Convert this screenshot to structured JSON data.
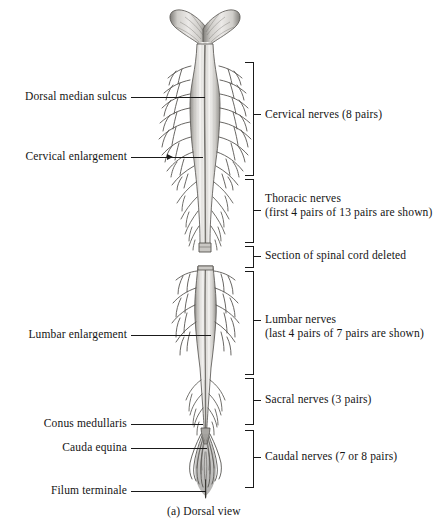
{
  "figure": {
    "caption": "(a) Dorsal view",
    "view": "Dorsal view of the spinal cord"
  },
  "left_labels": [
    {
      "id": "dorsal-median-sulcus",
      "text": "Dorsal median sulcus"
    },
    {
      "id": "cervical-enlargement",
      "text": "Cervical enlargement"
    },
    {
      "id": "lumbar-enlargement",
      "text": "Lumbar enlargement"
    },
    {
      "id": "conus-medullaris",
      "text": "Conus medullaris"
    },
    {
      "id": "cauda-equina",
      "text": "Cauda equina"
    },
    {
      "id": "filum-terminale",
      "text": "Filum terminale"
    }
  ],
  "right_brackets": [
    {
      "id": "cervical-nerves",
      "line1": "Cervical nerves (8 pairs)",
      "line2": ""
    },
    {
      "id": "thoracic-nerves",
      "line1": "Thoracic nerves",
      "line2": "(first 4 pairs of 13 pairs are shown)"
    },
    {
      "id": "section-deleted",
      "line1": "Section of spinal cord deleted",
      "line2": ""
    },
    {
      "id": "lumbar-nerves",
      "line1": "Lumbar nerves",
      "line2": "(last 4 pairs of 7 pairs are shown)"
    },
    {
      "id": "sacral-nerves",
      "line1": "Sacral nerves (3 pairs)",
      "line2": ""
    },
    {
      "id": "caudal-nerves",
      "line1": "Caudal nerves (7 or 8 pairs)",
      "line2": ""
    }
  ],
  "colors": {
    "ink": "#1a1a1a",
    "text": "#141414",
    "background": "#ffffff",
    "cord_light": "#f2f1ef",
    "cord_mid": "#b9b7b3",
    "cord_dark": "#6f6d69"
  }
}
